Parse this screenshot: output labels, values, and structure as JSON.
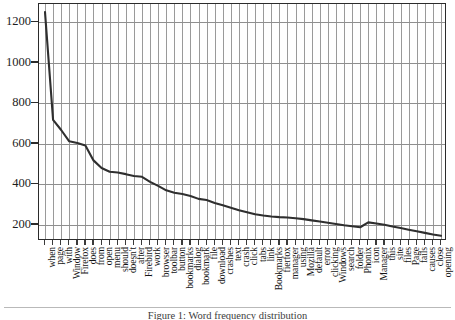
{
  "figure": {
    "caption": "Figure 1: Word frequency distribution",
    "background": "#ffffff",
    "line_color": "#2f2f2f",
    "grid_color": "#9a9a9a",
    "frame_color": "#2b2b2b"
  },
  "chart_data": {
    "type": "line",
    "title": "",
    "xlabel": "",
    "ylabel": "",
    "ylim": [
      120,
      1290
    ],
    "yticks": [
      200,
      400,
      600,
      800,
      1000,
      1200
    ],
    "grid": true,
    "legend": "none",
    "categories": [
      "when",
      "page",
      "with",
      "Window",
      "Firefox",
      "does",
      "from",
      "open",
      "menu",
      "should",
      "doesn't",
      "after",
      "Firebird",
      "work",
      "browser",
      "toolbar",
      "button",
      "bookmarks",
      "dialog",
      "bookmark",
      "file",
      "download",
      "crashes",
      "text",
      "crash",
      "click",
      "tabs",
      "link",
      "Bookmarks",
      "fierfox",
      "manager",
      "using",
      "Mozilla",
      "default",
      "error",
      "clicking",
      "Windows",
      "search",
      "folder",
      "Phonix",
      "icon",
      "Manager",
      "this",
      "site",
      "files",
      "Page",
      "fails",
      "causes",
      "close",
      "opening"
    ],
    "values": [
      1250,
      718,
      668,
      612,
      604,
      592,
      518,
      480,
      462,
      458,
      450,
      441,
      437,
      412,
      392,
      370,
      358,
      352,
      342,
      328,
      322,
      308,
      296,
      284,
      272,
      262,
      252,
      246,
      241,
      238,
      236,
      232,
      228,
      222,
      216,
      210,
      204,
      198,
      193,
      188,
      212,
      206,
      200,
      192,
      184,
      176,
      168,
      160,
      152,
      146
    ]
  }
}
